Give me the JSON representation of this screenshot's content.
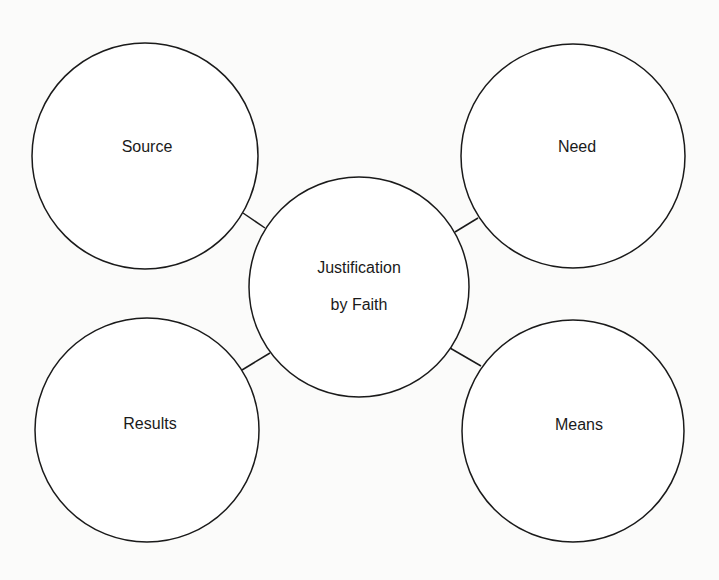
{
  "diagram": {
    "center": {
      "line1": "Justification",
      "line2": "by Faith",
      "cx": 359,
      "cy": 287,
      "r": 110
    },
    "nodes": [
      {
        "id": "source",
        "label": "Source",
        "cx": 145,
        "cy": 156,
        "r": 113,
        "tx": 147,
        "ty": 152
      },
      {
        "id": "need",
        "label": "Need",
        "cx": 573,
        "cy": 156,
        "r": 112,
        "tx": 577,
        "ty": 152
      },
      {
        "id": "results",
        "label": "Results",
        "cx": 147,
        "cy": 430,
        "r": 112,
        "tx": 150,
        "ty": 429
      },
      {
        "id": "means",
        "label": "Means",
        "cx": 573,
        "cy": 431,
        "r": 111,
        "tx": 579,
        "ty": 430
      }
    ],
    "connectors": [
      {
        "from": "source",
        "to": "center",
        "x1": 243,
        "y1": 213,
        "x2": 265,
        "y2": 228
      },
      {
        "from": "need",
        "to": "center",
        "x1": 478,
        "y1": 218,
        "x2": 455,
        "y2": 232
      },
      {
        "from": "results",
        "to": "center",
        "x1": 242,
        "y1": 370,
        "x2": 270,
        "y2": 353
      },
      {
        "from": "means",
        "to": "center",
        "x1": 450,
        "y1": 348,
        "x2": 481,
        "y2": 366
      }
    ],
    "stroke_color": "#1a1a1a",
    "fill_color": "#ffffff"
  }
}
